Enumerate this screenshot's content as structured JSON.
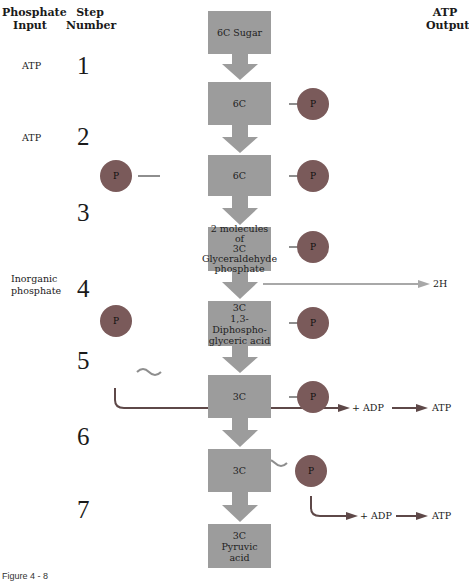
{
  "headers": {
    "phosphate_input": "Phosphate\nInput",
    "phosphate_input_l1": "Phosphate",
    "phosphate_input_l2": "Input",
    "step_number_l1": "Step",
    "step_number_l2": "Number",
    "atp_output_l1": "ATP",
    "atp_output_l2": "Output"
  },
  "inputs": [
    {
      "label": "ATP",
      "step": 1
    },
    {
      "label": "ATP",
      "step": 2
    },
    {
      "label_l1": "Inorganic",
      "label_l2": "phosphate",
      "step": 4
    }
  ],
  "steps": [
    "1",
    "2",
    "3",
    "4",
    "5",
    "6",
    "7"
  ],
  "boxes": [
    {
      "lines": [
        "6C Sugar"
      ]
    },
    {
      "lines": [
        "6C"
      ]
    },
    {
      "lines": [
        "6C"
      ]
    },
    {
      "lines": [
        "2 molecules of",
        "3C",
        "Glyceraldehyde",
        "phosphate"
      ]
    },
    {
      "lines": [
        "3C",
        "1,3-Diphospho-",
        "glyceric acid"
      ]
    },
    {
      "lines": [
        "3C"
      ]
    },
    {
      "lines": [
        "3C"
      ]
    },
    {
      "lines": [
        "3C",
        "Pyruvic",
        "acid"
      ]
    }
  ],
  "phosphate_symbol": "P",
  "bond_high_energy": "~",
  "outputs": {
    "hydrogen": "2H",
    "adp_1": "+ ADP",
    "atp_1": "ATP",
    "adp_2": "+ ADP",
    "atp_2": "ATP"
  },
  "caption": "Figure 4 - 8",
  "colors": {
    "box": "#9c9c9c",
    "phosphate_circle": "#7a5a5a",
    "arrow_main": "#9c9c9c",
    "hydrogen_arrow": "#a8a8a8",
    "atp_arrow": "#5e4848"
  }
}
